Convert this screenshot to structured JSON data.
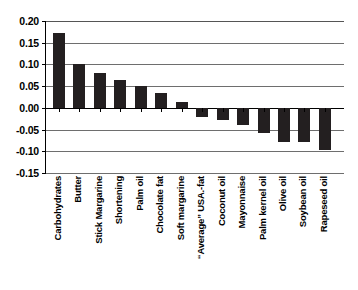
{
  "chart_data": {
    "type": "bar",
    "title": "",
    "subtitle": "",
    "xlabel": "",
    "ylabel": "",
    "ylim": [
      -0.15,
      0.2
    ],
    "grid": true,
    "legend": false,
    "orientation": "vertical",
    "bar_color": "#231f20",
    "categories": [
      "Carbohydrates",
      "Butter",
      "Stick Margarine",
      "Shortening",
      "Palm oil",
      "Chocolate fat",
      "Soft margarine",
      "“Average” USA.-fat",
      "Coconut oil",
      "Mayonnaise",
      "Palm kernel oil",
      "Olive oil",
      "Soybean oil",
      "Rapeseed oil"
    ],
    "values": [
      0.172,
      0.1,
      0.081,
      0.063,
      0.05,
      0.035,
      0.013,
      -0.02,
      -0.027,
      -0.04,
      -0.058,
      -0.078,
      -0.078,
      -0.096
    ],
    "yticks": [
      0.2,
      0.15,
      0.1,
      0.05,
      0.0,
      -0.05,
      -0.1,
      -0.15
    ],
    "ytick_labels": [
      "0.20",
      "0.15",
      "0.10",
      "0.05",
      "0.00",
      "-0.05",
      "-0.10",
      "-0.15"
    ]
  }
}
